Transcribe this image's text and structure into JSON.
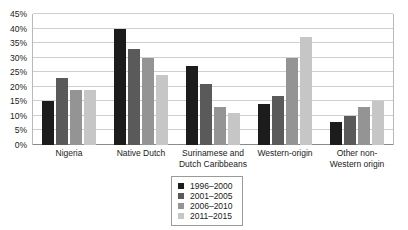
{
  "chart_data": {
    "type": "bar",
    "title": "",
    "subtitle": "",
    "xlabel": "",
    "ylabel": "",
    "ylim": [
      0,
      45
    ],
    "ytick_step": 5,
    "ytick_labels": [
      "0%",
      "5%",
      "10%",
      "15%",
      "20%",
      "25%",
      "30%",
      "35%",
      "40%",
      "45%"
    ],
    "grid": true,
    "legend_position": "bottom-center",
    "categories": [
      "Nigeria",
      "Native Dutch",
      "Surinamese and Dutch Caribbeans",
      "Western-origin",
      "Other non-Western origin"
    ],
    "series": [
      {
        "name": "1996–2000",
        "color": "#1c1c1c",
        "values": [
          15,
          40,
          27,
          14,
          8
        ]
      },
      {
        "name": "2001–2005",
        "color": "#5a5a5a",
        "values": [
          23,
          33,
          21,
          17,
          10
        ]
      },
      {
        "name": "2006–2010",
        "color": "#949494",
        "values": [
          19,
          30,
          13,
          30,
          13
        ]
      },
      {
        "name": "2011–2015",
        "color": "#c6c6c6",
        "values": [
          19,
          24,
          11,
          37,
          15
        ]
      }
    ]
  },
  "axis": {
    "y_ticks": [
      {
        "label": "45%",
        "value": 45
      },
      {
        "label": "40%",
        "value": 40
      },
      {
        "label": "35%",
        "value": 35
      },
      {
        "label": "30%",
        "value": 30
      },
      {
        "label": "25%",
        "value": 25
      },
      {
        "label": "20%",
        "value": 20
      },
      {
        "label": "15%",
        "value": 15
      },
      {
        "label": "10%",
        "value": 10
      },
      {
        "label": "5%",
        "value": 5
      },
      {
        "label": "0%",
        "value": 0
      }
    ]
  },
  "x_axis_labels": [
    "Nigeria",
    "Native Dutch",
    "Surinamese and Dutch Caribbeans",
    "Western-origin",
    "Other non-Western origin"
  ],
  "legend": {
    "entries": [
      {
        "label": "1996–2000",
        "color": "#1c1c1c"
      },
      {
        "label": "2001–2005",
        "color": "#5a5a5a"
      },
      {
        "label": "2006–2010",
        "color": "#949494"
      },
      {
        "label": "2011–2015",
        "color": "#c6c6c6"
      }
    ]
  }
}
